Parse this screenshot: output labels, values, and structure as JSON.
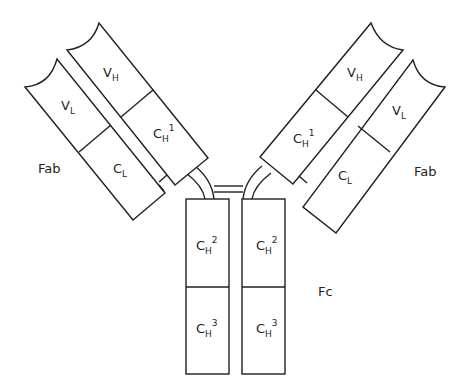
{
  "diagram": {
    "type": "antibody-structure",
    "labels": {
      "fab_left": "Fab",
      "fab_right": "Fab",
      "fc": "Fc"
    },
    "domains": {
      "left_vh": {
        "base": "V",
        "sub": "H",
        "sup": ""
      },
      "left_ch1": {
        "base": "C",
        "sub": "H",
        "sup": "1"
      },
      "left_vl": {
        "base": "V",
        "sub": "L",
        "sup": ""
      },
      "left_cl": {
        "base": "C",
        "sub": "L",
        "sup": ""
      },
      "right_vh": {
        "base": "V",
        "sub": "H",
        "sup": ""
      },
      "right_ch1": {
        "base": "C",
        "sub": "H",
        "sup": "1"
      },
      "right_vl": {
        "base": "V",
        "sub": "L",
        "sup": ""
      },
      "right_cl": {
        "base": "C",
        "sub": "L",
        "sup": ""
      },
      "left_ch2": {
        "base": "C",
        "sub": "H",
        "sup": "2"
      },
      "left_ch3": {
        "base": "C",
        "sub": "H",
        "sup": "3"
      },
      "right_ch2": {
        "base": "C",
        "sub": "H",
        "sup": "2"
      },
      "right_ch3": {
        "base": "C",
        "sub": "H",
        "sup": "3"
      }
    },
    "colors": {
      "stroke": "#231f20",
      "fill": "#ffffff"
    }
  }
}
